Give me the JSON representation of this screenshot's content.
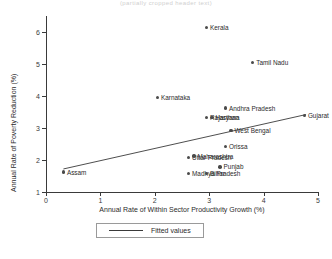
{
  "figure": {
    "top_caption": "(partially cropped header text)"
  },
  "legend": {
    "label": "Fitted values",
    "position": "below-axis-center"
  },
  "chart_data": {
    "type": "scatter",
    "title": "",
    "xlabel": "Annual Rate of Within Sector Productivity Growth (%)",
    "ylabel": "Annual Rate of Poverty Reduction (%)",
    "xlim": [
      0,
      5
    ],
    "ylim": [
      1,
      6.5
    ],
    "xticks": [
      0,
      1,
      2,
      3,
      4,
      5
    ],
    "yticks": [
      1,
      2,
      3,
      4,
      5,
      6
    ],
    "grid": false,
    "legend": [
      "Fitted values"
    ],
    "points": [
      {
        "label": "Kerala",
        "x": 2.95,
        "y": 6.15,
        "label_side": "right"
      },
      {
        "label": "Tamil Nadu",
        "x": 3.8,
        "y": 5.05,
        "label_side": "right"
      },
      {
        "label": "Karnataka",
        "x": 2.05,
        "y": 3.95,
        "label_side": "right"
      },
      {
        "label": "Andhra Pradesh",
        "x": 3.3,
        "y": 3.62,
        "label_side": "right"
      },
      {
        "label": "Gujarat",
        "x": 4.75,
        "y": 3.4,
        "label_side": "right"
      },
      {
        "label": "Rajasthan",
        "x": 2.95,
        "y": 3.32,
        "label_side": "right"
      },
      {
        "label": "Haryana",
        "x": 3.05,
        "y": 3.32,
        "label_side": "right"
      },
      {
        "label": "West Bengal",
        "x": 3.4,
        "y": 2.92,
        "label_side": "right"
      },
      {
        "label": "Orissa",
        "x": 3.3,
        "y": 2.42,
        "label_side": "right"
      },
      {
        "label": "Uttar Pradesh",
        "x": 2.62,
        "y": 2.08,
        "label_side": "right"
      },
      {
        "label": "Maharashtra",
        "x": 2.72,
        "y": 2.12,
        "label_side": "right"
      },
      {
        "label": "Assam",
        "x": 0.32,
        "y": 1.62,
        "label_side": "right"
      },
      {
        "label": "Punjab",
        "x": 3.2,
        "y": 1.78,
        "label_side": "right"
      },
      {
        "label": "Madhya Pradesh",
        "x": 2.62,
        "y": 1.58,
        "label_side": "right"
      },
      {
        "label": "Bihar",
        "x": 2.95,
        "y": 1.58,
        "label_side": "right"
      }
    ],
    "fit_line": {
      "name": "Fitted values",
      "x": [
        0.32,
        4.78
      ],
      "y": [
        1.72,
        3.42
      ]
    }
  }
}
